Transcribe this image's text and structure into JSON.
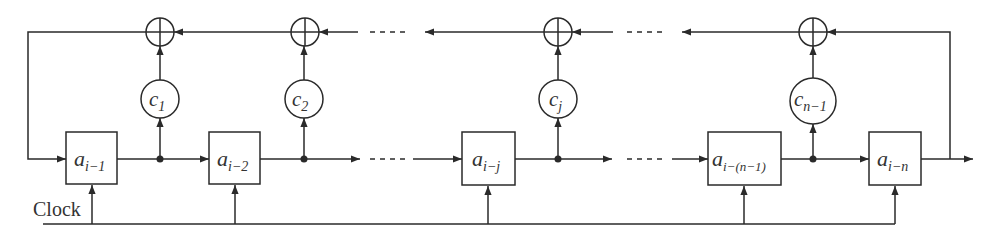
{
  "diagram": {
    "type": "linear-feedback-shift-register",
    "stroke_color": "#2a2a2a",
    "text_color": "#333333",
    "clock_label": "Clock",
    "registers": [
      {
        "base": "a",
        "sub": "i−1"
      },
      {
        "base": "a",
        "sub": "i−2"
      },
      {
        "base": "a",
        "sub": "i−j"
      },
      {
        "base": "a",
        "sub": "i−(n−1)"
      },
      {
        "base": "a",
        "sub": "i−n"
      }
    ],
    "coefficients": [
      {
        "base": "c",
        "sub": "1"
      },
      {
        "base": "c",
        "sub": "2"
      },
      {
        "base": "c",
        "sub": "j"
      },
      {
        "base": "c",
        "sub": "n−1"
      }
    ],
    "adders": [
      "⊕",
      "⊕",
      "⊕",
      "⊕"
    ],
    "ellipsis": "- - - -"
  }
}
